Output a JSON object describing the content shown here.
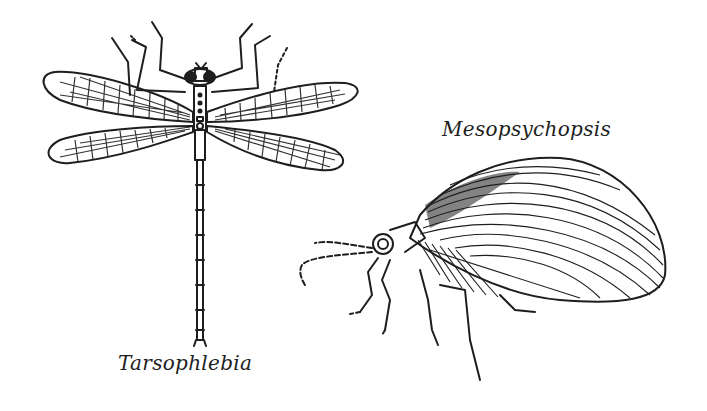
{
  "figure": {
    "specimens": [
      {
        "name": "Tarsophlebia",
        "description": "dragonfly-like fossil insect, dorsal view with four net-veined wings"
      },
      {
        "name": "Mesopsychopsis",
        "description": "lacewing-like fossil insect, lateral view with large striated wing"
      }
    ]
  },
  "colors": {
    "ink": "#1e1e1e",
    "background": "#ffffff"
  }
}
